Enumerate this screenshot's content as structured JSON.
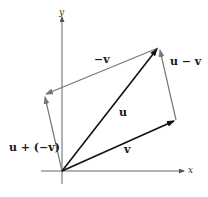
{
  "diagram": {
    "axes": {
      "x_label": "x",
      "y_label": "y"
    },
    "vectors": [
      {
        "id": "u",
        "label": "u",
        "from": [
          0,
          0
        ],
        "to": "u",
        "color": "#111111"
      },
      {
        "id": "v",
        "label": "v",
        "from": [
          0,
          0
        ],
        "to": "v",
        "color": "#111111"
      },
      {
        "id": "neg_v",
        "label": "−v",
        "from": "u",
        "to": "u−v",
        "color": "#777777"
      },
      {
        "id": "u_minus_v",
        "label": "u − v",
        "from": "v",
        "to": "u",
        "color": "#777777"
      },
      {
        "id": "u_plus_neg_v",
        "label": "u + (−v)",
        "from": [
          0,
          0
        ],
        "to": "u−v",
        "color": "#777777"
      }
    ],
    "labels": {
      "u": "u",
      "v": "v",
      "neg_v": "−v",
      "u_minus_v": "u − v",
      "u_plus_neg_v": "u + (−v)"
    },
    "colors": {
      "primary_vector": "#111111",
      "secondary_vector": "#777777",
      "axis": "#555555"
    }
  }
}
